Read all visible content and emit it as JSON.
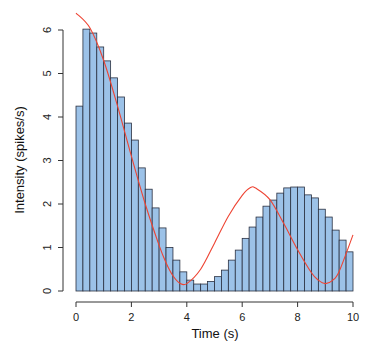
{
  "chart_data": {
    "type": "bar",
    "subtype": "histogram-with-curve",
    "title": "",
    "xlabel": "Time (s)",
    "ylabel": "Intensity (spikes/s)",
    "xlim": [
      0,
      10
    ],
    "ylim": [
      0,
      6
    ],
    "xticks": [
      0,
      2,
      4,
      6,
      8,
      10
    ],
    "xtick_labels": [
      "0",
      "2",
      "4",
      "6",
      "8",
      "10"
    ],
    "yticks": [
      0,
      1,
      2,
      3,
      4,
      5,
      6
    ],
    "ytick_labels": [
      "0",
      "1",
      "2",
      "3",
      "4",
      "5",
      "6"
    ],
    "grid": false,
    "legend": null,
    "bin_width": 0.25,
    "bin_starts": [
      0,
      0.25,
      0.5,
      0.75,
      1,
      1.25,
      1.5,
      1.75,
      2,
      2.25,
      2.5,
      2.75,
      3,
      3.25,
      3.5,
      3.75,
      4,
      4.25,
      4.5,
      4.75,
      5,
      5.25,
      5.5,
      5.75,
      6,
      6.25,
      6.5,
      6.75,
      7,
      7.25,
      7.5,
      7.75,
      8,
      8.25,
      8.5,
      8.75,
      9,
      9.25,
      9.5,
      9.75
    ],
    "series": [
      {
        "name": "Histogram",
        "kind": "bar",
        "color": "#9cc2e8",
        "values": [
          4.25,
          6.02,
          5.93,
          5.61,
          5.29,
          4.9,
          4.46,
          3.86,
          3.47,
          2.83,
          2.34,
          1.91,
          1.45,
          1.0,
          0.71,
          0.44,
          0.25,
          0.16,
          0.16,
          0.22,
          0.33,
          0.48,
          0.71,
          0.94,
          1.21,
          1.47,
          1.7,
          1.95,
          2.09,
          2.25,
          2.37,
          2.39,
          2.39,
          2.21,
          2.14,
          1.88,
          1.7,
          1.4,
          1.17,
          0.9
        ]
      },
      {
        "name": "Intensity curve",
        "kind": "line",
        "color": "#ee4433",
        "x": [
          0,
          0.5,
          1,
          1.5,
          2,
          2.5,
          3,
          3.25,
          3.5,
          3.75,
          4,
          4.5,
          5,
          5.5,
          6,
          6.3,
          6.5,
          7,
          7.5,
          8,
          8.5,
          8.75,
          9,
          9.25,
          9.5,
          10
        ],
        "y": [
          6.39,
          6.05,
          5.3,
          4.25,
          3.1,
          2.0,
          1.05,
          0.65,
          0.35,
          0.18,
          0.17,
          0.5,
          1.1,
          1.72,
          2.2,
          2.38,
          2.36,
          2.1,
          1.55,
          0.95,
          0.42,
          0.25,
          0.17,
          0.24,
          0.45,
          1.29
        ]
      }
    ]
  }
}
